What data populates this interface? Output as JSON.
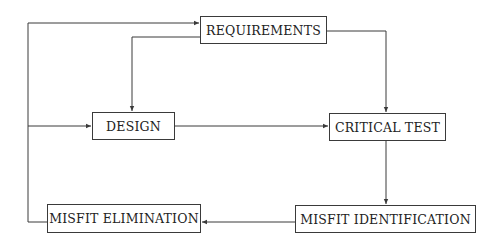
{
  "diagram": {
    "type": "flowchart",
    "nodes": [
      {
        "id": "requirements",
        "label": "REQUIREMENTS"
      },
      {
        "id": "design",
        "label": "DESIGN"
      },
      {
        "id": "critical_test",
        "label": "CRITICAL TEST"
      },
      {
        "id": "misfit_identification",
        "label": "MISFIT IDENTIFICATION"
      },
      {
        "id": "misfit_elimination",
        "label": "MISFIT ELIMINATION"
      }
    ],
    "edges": [
      {
        "from": "requirements",
        "to": "design"
      },
      {
        "from": "requirements",
        "to": "critical_test"
      },
      {
        "from": "design",
        "to": "critical_test"
      },
      {
        "from": "critical_test",
        "to": "misfit_identification"
      },
      {
        "from": "misfit_identification",
        "to": "misfit_elimination"
      },
      {
        "from": "misfit_elimination",
        "to": "requirements"
      },
      {
        "from": "misfit_elimination",
        "to": "design"
      }
    ]
  }
}
